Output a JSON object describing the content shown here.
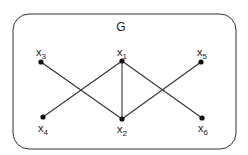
{
  "graph": {
    "title": "G",
    "nodes": [
      {
        "id": "x1",
        "label": "x",
        "sub": "1",
        "x": 122,
        "y": 61,
        "lx": 117,
        "ly": 56
      },
      {
        "id": "x2",
        "label": "x",
        "sub": "2",
        "x": 122,
        "y": 119,
        "lx": 117,
        "ly": 133
      },
      {
        "id": "x3",
        "label": "x",
        "sub": "3",
        "x": 41,
        "y": 62,
        "lx": 36,
        "ly": 56
      },
      {
        "id": "x4",
        "label": "x",
        "sub": "4",
        "x": 43,
        "y": 117,
        "lx": 38,
        "ly": 132
      },
      {
        "id": "x5",
        "label": "x",
        "sub": "5",
        "x": 201,
        "y": 62,
        "lx": 197,
        "ly": 56
      },
      {
        "id": "x6",
        "label": "x",
        "sub": "6",
        "x": 202,
        "y": 118,
        "lx": 198,
        "ly": 132
      }
    ],
    "edges": [
      [
        "x3",
        "x2"
      ],
      [
        "x1",
        "x4"
      ],
      [
        "x1",
        "x2"
      ],
      [
        "x1",
        "x6"
      ],
      [
        "x2",
        "x5"
      ]
    ]
  }
}
